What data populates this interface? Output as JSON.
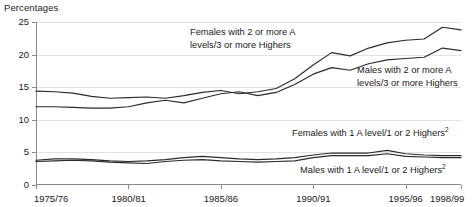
{
  "axis_title": "Percentages",
  "annotations": {
    "females_two_plus_line1": "Females with 2 or more A",
    "females_two_plus_line2": "levels/3 or more Highers",
    "males_two_plus_line1": "Males with 2 or more A",
    "males_two_plus_line2": "levels/3 or more Highers",
    "females_one_a_main": "Females with 1 A  level/1 or 2 Highers",
    "females_one_a_sup": "2",
    "males_one_a_main": "Males with 1 A  level/1 or 2 Highers",
    "males_one_a_sup": "2"
  },
  "chart_data": {
    "type": "line",
    "title": "",
    "xlabel": "",
    "ylabel": "Percentages",
    "ylim": [
      0,
      25
    ],
    "xlim": [
      0,
      23
    ],
    "grid": true,
    "legend_position": "inline-annotations",
    "yticks": [
      0,
      5,
      10,
      15,
      20,
      25
    ],
    "ytick_labels": [
      "0",
      "5",
      "10",
      "15",
      "20",
      "25"
    ],
    "x": [
      "1975/76",
      "1976/77",
      "1977/78",
      "1978/79",
      "1979/80",
      "1980/81",
      "1981/82",
      "1982/83",
      "1983/84",
      "1984/85",
      "1985/86",
      "1986/87",
      "1987/88",
      "1988/89",
      "1989/90",
      "1990/91",
      "1991/92",
      "1992/93",
      "1993/94",
      "1994/95",
      "1995/96",
      "1996/97",
      "1997/98",
      "1998/99"
    ],
    "xtick_labels": [
      "1975/76",
      "1980/81",
      "1985/86",
      "1990/91",
      "1995/96",
      "1998/99"
    ],
    "xtick_indices": [
      0,
      5,
      10,
      15,
      20,
      23
    ],
    "series": [
      {
        "name": "Females with 2 or more A levels/3 or more Highers",
        "color": "#2b2b2b",
        "values": [
          14.4,
          14.3,
          14.1,
          13.6,
          13.3,
          13.4,
          13.5,
          13.3,
          13.7,
          14.2,
          14.5,
          14.0,
          14.3,
          14.8,
          16.3,
          18.4,
          20.3,
          19.8,
          21.0,
          21.8,
          22.2,
          22.4,
          24.2,
          23.8
        ]
      },
      {
        "name": "Males with 2 or more A levels/3 or more Highers",
        "color": "#2b2b2b",
        "values": [
          12.0,
          12.0,
          11.9,
          11.8,
          11.8,
          12.0,
          12.6,
          13.0,
          12.6,
          13.3,
          14.0,
          14.3,
          13.7,
          14.2,
          15.4,
          17.0,
          18.0,
          17.6,
          18.6,
          19.2,
          19.4,
          19.6,
          21.0,
          20.6
        ]
      },
      {
        "name": "Females with 1 A level/1 or 2 Highers",
        "color": "#2b2b2b",
        "values": [
          3.8,
          4.0,
          4.0,
          3.9,
          3.7,
          3.6,
          3.7,
          3.9,
          4.2,
          4.4,
          4.2,
          4.0,
          3.9,
          4.0,
          4.2,
          4.6,
          4.9,
          4.9,
          4.9,
          5.3,
          4.8,
          4.6,
          4.5,
          4.5
        ]
      },
      {
        "name": "Males with 1 A level/1 or 2 Highers",
        "color": "#2b2b2b",
        "values": [
          3.6,
          3.7,
          3.8,
          3.7,
          3.5,
          3.4,
          3.3,
          3.6,
          3.8,
          3.9,
          3.7,
          3.6,
          3.5,
          3.6,
          3.7,
          4.2,
          4.5,
          4.5,
          4.5,
          4.8,
          4.4,
          4.3,
          4.2,
          4.2
        ]
      }
    ]
  }
}
